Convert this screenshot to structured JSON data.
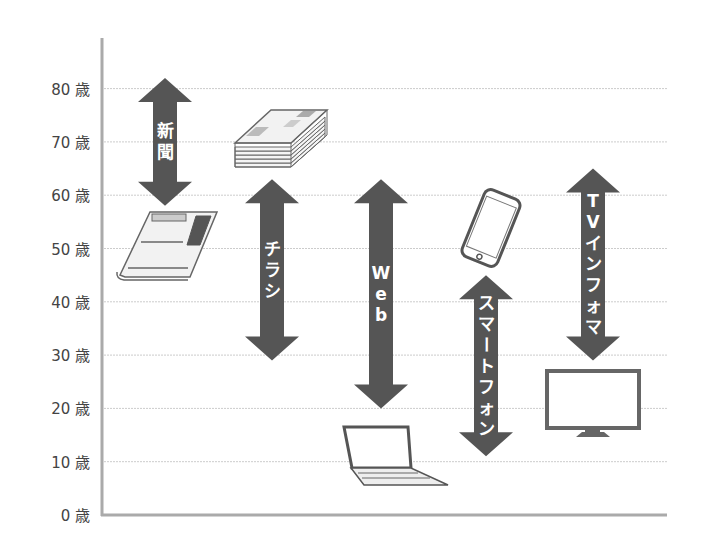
{
  "chart_data": {
    "type": "range",
    "title": "",
    "xlabel": "",
    "ylabel": "",
    "ylim": [
      0,
      80
    ],
    "y_unit": "歳",
    "y_ticks": [
      0,
      10,
      20,
      30,
      40,
      50,
      60,
      70,
      80
    ],
    "y_tick_labels": [
      "0 歳",
      "10 歳",
      "20 歳",
      "30 歳",
      "40 歳",
      "50 歳",
      "60 歳",
      "70 歳",
      "80 歳"
    ],
    "grid": true,
    "legend": "none",
    "series": [
      {
        "name": "新聞",
        "label_chars": [
          "新",
          "聞"
        ],
        "min_age": 58,
        "max_age": 82,
        "icon": "newspaper-icon"
      },
      {
        "name": "チラシ",
        "label_chars": [
          "チ",
          "ラ",
          "シ"
        ],
        "min_age": 29,
        "max_age": 63,
        "icon": "flyer-stack-icon"
      },
      {
        "name": "Web",
        "label_chars": [
          "W",
          "e",
          "b"
        ],
        "min_age": 20,
        "max_age": 63,
        "icon": "laptop-icon"
      },
      {
        "name": "スマートフォン",
        "label_chars": [
          "ス",
          "マ",
          "ー",
          "ト",
          "フ",
          "ォ",
          "ン"
        ],
        "min_age": 11,
        "max_age": 45,
        "icon": "smartphone-icon"
      },
      {
        "name": "TVインフォマ",
        "label_chars": [
          "T",
          "V",
          "イ",
          "ン",
          "フ",
          "ォ",
          "マ"
        ],
        "min_age": 29,
        "max_age": 65,
        "icon": "tv-icon"
      }
    ]
  },
  "colors": {
    "arrow": "#555555",
    "grid": "#cccccc",
    "axis": "#aaaaaa",
    "label_text": "#444444"
  }
}
